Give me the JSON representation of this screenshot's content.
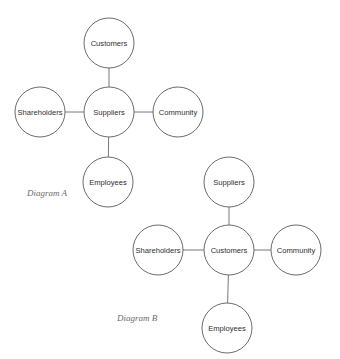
{
  "diagrams": [
    {
      "id": "A",
      "caption": "Diagram A",
      "caption_pos": {
        "x": 27,
        "y": 193
      },
      "radius": 25,
      "center": {
        "label": "Suppliers",
        "x": 109,
        "y": 112
      },
      "top": {
        "label": "Customers",
        "x": 109,
        "y": 43
      },
      "left": {
        "label": "Shareholders",
        "x": 40,
        "y": 112
      },
      "right": {
        "label": "Community",
        "x": 178,
        "y": 112
      },
      "bottom": {
        "label": "Employees",
        "x": 108,
        "y": 182
      }
    },
    {
      "id": "B",
      "caption": "Diagram B",
      "caption_pos": {
        "x": 117,
        "y": 318
      },
      "radius": 25,
      "center": {
        "label": "Customers",
        "x": 229,
        "y": 250
      },
      "top": {
        "label": "Suppliers",
        "x": 229,
        "y": 182
      },
      "left": {
        "label": "Shareholders",
        "x": 158,
        "y": 250
      },
      "right": {
        "label": "Community",
        "x": 296,
        "y": 250
      },
      "bottom": {
        "label": "Employees",
        "x": 227,
        "y": 328
      }
    }
  ],
  "colors": {
    "background": "#ffffff",
    "circle_stroke": "#5a5a5a",
    "connector": "#6a6a6a",
    "label_text": "#2e2e2e",
    "caption_text": "#6b6b6b"
  }
}
